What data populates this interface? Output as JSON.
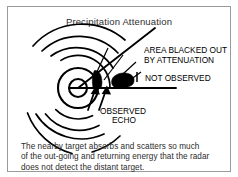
{
  "figure": {
    "title": "Precipitation Attenuation",
    "background_color": "#ffffff",
    "ink_color": "#000000",
    "frame_color": "#9a9a9a"
  },
  "labels": {
    "blacked_out_line1": "AREA BLACKED OUT",
    "blacked_out_line2": "BY ATTENUATION",
    "not_observed": "NOT OBSERVED",
    "observed_line1": "OBSERVED",
    "observed_line2": "ECHO"
  },
  "caption": {
    "line1": "The nearby target absorbs and scatters so much",
    "line2": "of the out-going and returning energy that the radar",
    "line3": "does not detect the distant target."
  },
  "diagram": {
    "radar_origin_x": 78,
    "radar_origin_y": 88,
    "inner_circle_radius": 9,
    "second_circle_radius": 20,
    "arc_radii": [
      32,
      43,
      54,
      66
    ],
    "beam_upper_angle_deg": -38,
    "beam_lower_angle_deg": 0,
    "beam_line_end_x": 176,
    "near_target_label": "observed-echo-target",
    "far_target_label": "not-observed-target"
  }
}
